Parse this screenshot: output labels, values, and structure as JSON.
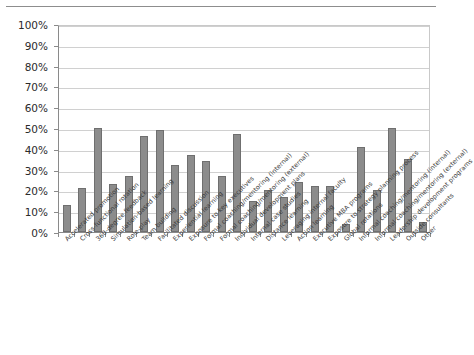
{
  "chart_data": {
    "type": "bar",
    "title": "",
    "subtitle": "",
    "xlabel": "",
    "ylabel": "",
    "ylim": [
      0,
      100
    ],
    "ytick_labels": [
      "100%",
      "90%",
      "80%",
      "70%",
      "60%",
      "50%",
      "40%",
      "30%",
      "20%",
      "10%",
      "0%"
    ],
    "ytick_values": [
      100,
      90,
      80,
      70,
      60,
      50,
      40,
      30,
      20,
      10,
      0
    ],
    "grid": true,
    "legend": null,
    "legend_position": "none",
    "bar_color": "#8c8c8c",
    "bar_edge_color": "#6f6f6f",
    "value_suffix": "%",
    "categories": [
      "Accelerated promotion",
      "Cross-functional rotation",
      "360-degree feedback",
      "Simulation-based learning",
      "Role-play",
      "Team building",
      "Facilitated discussion",
      "Experiential learning",
      "Exposure to key executives",
      "Formal coaching/mentoring (internal)",
      "Formal coaching/mentoring (external)",
      "Individual development plans",
      "Internal case studies",
      "Distance learning",
      "Leveraging internal faculty",
      "Action learning",
      "Executive MBA programs",
      "Exposure to strategy planning process",
      "Global rotations",
      "Informal coaching/mentoring (internal)",
      "Informal coaching/mentoring (external)",
      "Leadership development programs",
      "Outside consultants",
      "Other"
    ],
    "values": [
      13,
      21,
      50,
      23,
      27,
      46,
      49,
      32,
      37,
      34,
      27,
      47,
      15,
      20,
      17,
      24,
      22,
      22,
      4,
      41,
      20,
      50,
      35,
      5
    ]
  }
}
